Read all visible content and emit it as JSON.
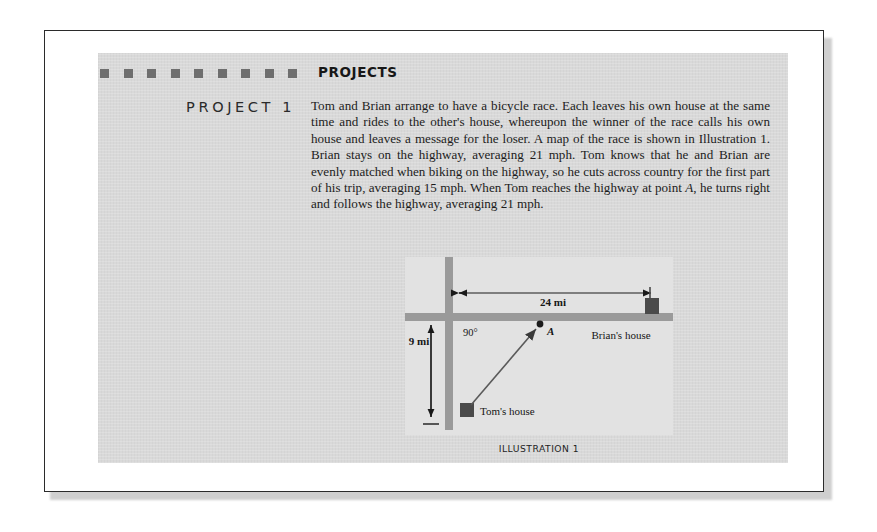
{
  "page": {
    "header": {
      "title": "PROJECTS",
      "square_count": 9,
      "square_color": "#6e6e6e"
    },
    "project": {
      "label": "PROJECT 1",
      "body": "Tom and Brian arrange to have a bicycle race. Each leaves his own house at the same time and rides to the other's house, whereupon the winner of the race calls his own house and leaves a message for the loser. A map of the race is shown in Illustration 1. Brian stays on the highway, averaging 21 mph. Tom knows that he and Brian are evenly matched when biking on the highway, so he cuts across country for the first part of his trip, averaging 15 mph. When Tom reaches the highway at point A, he turns right and follows the highway, averaging 21 mph."
    },
    "illustration": {
      "caption": "ILLUSTRATION 1",
      "labels": {
        "horizontal_distance": "24 mi",
        "vertical_distance": "9 mi",
        "angle": "90°",
        "point": "A",
        "brians_house": "Brian's house",
        "toms_house": "Tom's house"
      },
      "colors": {
        "road": "#9a9a9a",
        "house": "#4a4a4a",
        "background": "#e2e2e2",
        "panel": "#d9d9d9"
      }
    }
  }
}
